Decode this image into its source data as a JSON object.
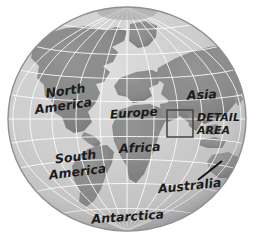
{
  "figure": {
    "type": "globe-illustration",
    "background_color": "#ffffff"
  },
  "colors": {
    "ocean": "#c9c9c9",
    "ocean_light": "#d6d6d6",
    "land": "#8a8a8a",
    "land_shadow": "#7a7a7a",
    "graticule": "#ffffff",
    "graticule_dark": "#9a9a9a",
    "outline": "#8f8f8f",
    "label_text": "#1c1c1c",
    "detail_box_stroke": "#4a4a4a",
    "leader_line": "#111111"
  },
  "globe": {
    "center_x": 127,
    "center_y": 119,
    "radius_x": 119,
    "radius_y": 112,
    "graticule": {
      "meridian_count": 24,
      "parallel_count": 11,
      "visible": true
    }
  },
  "labels": [
    {
      "id": "north-america",
      "text": "North",
      "x": 66,
      "y": 95,
      "size": "lg",
      "rotate": -8
    },
    {
      "id": "north-america",
      "text": "America",
      "x": 64,
      "y": 110,
      "size": "lg",
      "rotate": -8
    },
    {
      "id": "europe",
      "text": "Europe",
      "x": 134,
      "y": 117,
      "size": "md",
      "rotate": -4
    },
    {
      "id": "asia",
      "text": "Asia",
      "x": 202,
      "y": 99,
      "size": "lg",
      "rotate": -3
    },
    {
      "id": "africa",
      "text": "Africa",
      "x": 140,
      "y": 152,
      "size": "lg",
      "rotate": -3
    },
    {
      "id": "south-america",
      "text": "South",
      "x": 76,
      "y": 161,
      "size": "lg",
      "rotate": -7
    },
    {
      "id": "south-america",
      "text": "America",
      "x": 78,
      "y": 176,
      "size": "lg",
      "rotate": -7
    },
    {
      "id": "australia",
      "text": "Australia",
      "x": 190,
      "y": 190,
      "size": "lg",
      "rotate": -6
    },
    {
      "id": "antarctica",
      "text": "Antarctica",
      "x": 128,
      "y": 221,
      "size": "lg",
      "rotate": -4
    }
  ],
  "detail_callout": {
    "line1": "DETAIL",
    "line2": "AREA",
    "text_x": 197,
    "text_y1": 121,
    "text_y2": 134,
    "box": {
      "x": 167,
      "y": 110,
      "width": 26,
      "height": 27
    }
  },
  "australia_leader_line": {
    "x1": 198,
    "y1": 180,
    "x2": 222,
    "y2": 161
  }
}
